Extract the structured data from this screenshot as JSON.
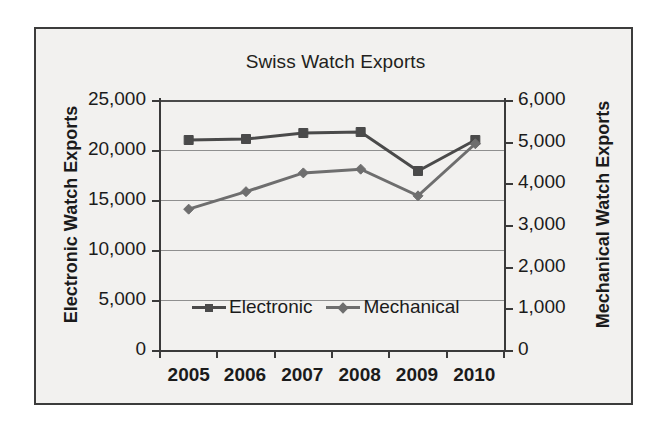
{
  "chart_data": {
    "type": "line",
    "title": "Swiss Watch Exports",
    "xlabel": "",
    "ylabel": "Electronic Watch Exports",
    "y2label": "Mechanical Watch Exports",
    "categories": [
      "2005",
      "2006",
      "2007",
      "2008",
      "2009",
      "2010"
    ],
    "x": [
      2005,
      2006,
      2007,
      2008,
      2009,
      2010
    ],
    "ylim": [
      0,
      25000
    ],
    "y2lim": [
      0,
      6000
    ],
    "yticks": [
      "0",
      "5,000",
      "10,000",
      "15,000",
      "20,000",
      "25,000"
    ],
    "ytick_values": [
      0,
      5000,
      10000,
      15000,
      20000,
      25000
    ],
    "y2ticks": [
      "0",
      "1,000",
      "2,000",
      "3,000",
      "4,000",
      "5,000",
      "6,000"
    ],
    "y2tick_values": [
      0,
      1000,
      2000,
      3000,
      4000,
      5000,
      6000
    ],
    "grid": true,
    "legend_position": "inside-bottom-center",
    "series": [
      {
        "name": "Electronic",
        "axis": "left",
        "marker": "square",
        "color": "#4a4a4a",
        "values": [
          21000,
          21100,
          21700,
          21800,
          17900,
          21000
        ]
      },
      {
        "name": "Mechanical",
        "axis": "right",
        "marker": "diamond",
        "color": "#6e6e6e",
        "values": [
          3380,
          3800,
          4250,
          4340,
          3700,
          4950
        ]
      }
    ]
  },
  "chart": {
    "title": "Swiss Watch Exports",
    "left_axis": {
      "title": "Electronic Watch Exports",
      "ticks": [
        "25,000",
        "20,000",
        "15,000",
        "10,000",
        "5,000",
        "0"
      ]
    },
    "right_axis": {
      "title": "Mechanical Watch Exports",
      "ticks": [
        "6,000",
        "5,000",
        "4,000",
        "3,000",
        "2,000",
        "1,000",
        "0"
      ]
    },
    "x_axis": {
      "ticks": [
        "2005",
        "2006",
        "2007",
        "2008",
        "2009",
        "2010"
      ]
    },
    "legend": [
      {
        "label": "Electronic",
        "marker": "square-marker",
        "color": "#4a4a4a"
      },
      {
        "label": "Mechanical",
        "marker": "diamond-marker",
        "color": "#6e6e6e"
      }
    ]
  },
  "colors": {
    "frame_border": "#3c3c3c",
    "figure_background": "#f2f1ef",
    "gridline": "#8f8f8f",
    "axis_line": "#3a3a3a",
    "text": "#1b1b1b",
    "electronic_series": "#4a4a4a",
    "mechanical_series": "#6e6e6e"
  }
}
